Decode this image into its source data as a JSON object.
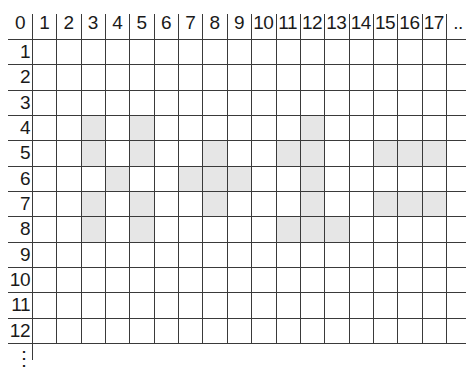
{
  "grid": {
    "column_headers": [
      "0",
      "1",
      "2",
      "3",
      "4",
      "5",
      "6",
      "7",
      "8",
      "9",
      "10",
      "11",
      "12",
      "13",
      "14",
      "15",
      "16",
      "17",
      ".."
    ],
    "row_labels": [
      "1",
      "2",
      "3",
      "4",
      "5",
      "6",
      "7",
      "8",
      "9",
      "10",
      "11",
      "12"
    ],
    "row_continuation": "⋮",
    "shade_color": "#e6e6e6",
    "line_color": "#3a3a3a",
    "shaded_cells": [
      {
        "row": 4,
        "col": 3
      },
      {
        "row": 4,
        "col": 5
      },
      {
        "row": 4,
        "col": 12
      },
      {
        "row": 5,
        "col": 3
      },
      {
        "row": 5,
        "col": 5
      },
      {
        "row": 5,
        "col": 8
      },
      {
        "row": 5,
        "col": 11
      },
      {
        "row": 5,
        "col": 12
      },
      {
        "row": 5,
        "col": 15
      },
      {
        "row": 5,
        "col": 16
      },
      {
        "row": 5,
        "col": 17
      },
      {
        "row": 6,
        "col": 4
      },
      {
        "row": 6,
        "col": 7
      },
      {
        "row": 6,
        "col": 8
      },
      {
        "row": 6,
        "col": 9
      },
      {
        "row": 6,
        "col": 12
      },
      {
        "row": 7,
        "col": 3
      },
      {
        "row": 7,
        "col": 5
      },
      {
        "row": 7,
        "col": 8
      },
      {
        "row": 7,
        "col": 12
      },
      {
        "row": 7,
        "col": 15
      },
      {
        "row": 7,
        "col": 16
      },
      {
        "row": 7,
        "col": 17
      },
      {
        "row": 8,
        "col": 3
      },
      {
        "row": 8,
        "col": 5
      },
      {
        "row": 8,
        "col": 11
      },
      {
        "row": 8,
        "col": 12
      },
      {
        "row": 8,
        "col": 13
      }
    ]
  }
}
